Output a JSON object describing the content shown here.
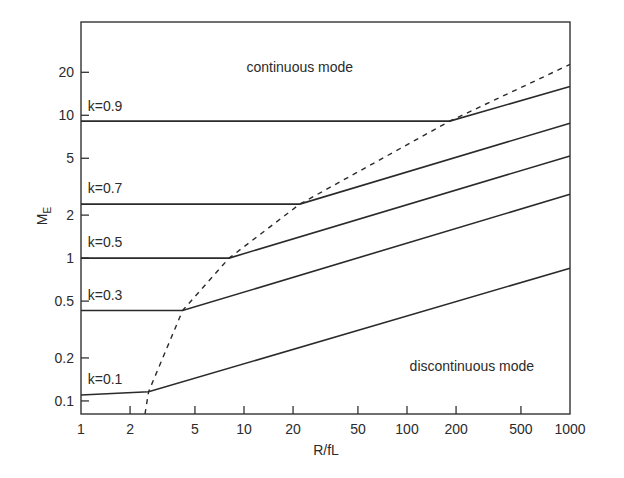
{
  "chart_data": {
    "type": "line",
    "title": "",
    "xlabel": "R/fL",
    "ylabel": "M",
    "ylabel_subscript": "E",
    "xscale": "log",
    "yscale": "log",
    "xlim": [
      1,
      1000
    ],
    "ylim": [
      0.081,
      45
    ],
    "grid": false,
    "legend": "none",
    "xticks": [
      1,
      2,
      5,
      10,
      20,
      50,
      100,
      200,
      500,
      1000
    ],
    "xtick_labels": [
      "1",
      "2",
      "5",
      "10",
      "20",
      "50",
      "100",
      "200",
      "500",
      "1000"
    ],
    "yticks": [
      0.1,
      0.2,
      0.5,
      1,
      2,
      5,
      10,
      20
    ],
    "ytick_labels": [
      "0.1",
      "0.2",
      "0.5",
      "1",
      "2",
      "5",
      "10",
      "20"
    ],
    "series": [
      {
        "name": "k=0.9",
        "style": "solid",
        "points": [
          [
            1,
            9.1
          ],
          [
            183,
            9.1
          ],
          [
            1000,
            15.9
          ]
        ]
      },
      {
        "name": "k=0.7",
        "style": "solid",
        "points": [
          [
            1,
            2.39
          ],
          [
            22,
            2.39
          ],
          [
            1000,
            8.8
          ]
        ]
      },
      {
        "name": "k=0.5",
        "style": "solid",
        "points": [
          [
            1,
            1.0
          ],
          [
            8.1,
            1.0
          ],
          [
            1000,
            5.2
          ]
        ]
      },
      {
        "name": "k=0.3",
        "style": "solid",
        "points": [
          [
            1,
            0.43
          ],
          [
            4.2,
            0.43
          ],
          [
            1000,
            2.8
          ]
        ]
      },
      {
        "name": "k=0.1",
        "style": "solid",
        "points": [
          [
            1,
            0.11
          ],
          [
            2.6,
            0.116
          ],
          [
            1000,
            0.85
          ]
        ]
      },
      {
        "name": "mode boundary",
        "style": "dashed",
        "points": [
          [
            2.47,
            0.081
          ],
          [
            2.6,
            0.116
          ],
          [
            4.2,
            0.43
          ],
          [
            8.1,
            1.0
          ],
          [
            22,
            2.39
          ],
          [
            183,
            9.1
          ],
          [
            1000,
            22.7
          ]
        ]
      }
    ],
    "series_labels": [
      {
        "text": "k=0.9",
        "x": 1.1,
        "y": 10.8
      },
      {
        "text": "k=0.7",
        "x": 1.1,
        "y": 2.85
      },
      {
        "text": "k=0.5",
        "x": 1.1,
        "y": 1.2
      },
      {
        "text": "k=0.3",
        "x": 1.1,
        "y": 0.51
      },
      {
        "text": "k=0.1",
        "x": 1.1,
        "y": 0.132
      }
    ],
    "annotations": [
      {
        "text": "continuous mode",
        "x": 22,
        "y": 20
      },
      {
        "text": "discontinuous mode",
        "x": 250,
        "y": 0.163
      }
    ]
  }
}
